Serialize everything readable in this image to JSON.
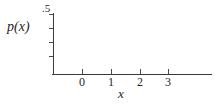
{
  "chart_data": {
    "type": "line",
    "title": "",
    "xlabel": "x",
    "ylabel": "p(x)",
    "xlim": [
      -1,
      4.55
    ],
    "ylim": [
      0,
      0.5
    ],
    "grid": false,
    "legend": null,
    "series": [],
    "x": [],
    "values": [],
    "note": "Empty axes: no data plotted inside the frame.",
    "x_tick_labels": [
      "0",
      "1",
      "2",
      "3"
    ],
    "x_tick_values": [
      0,
      1,
      2,
      3
    ],
    "y_tick_labels": [
      ".5"
    ],
    "y_tick_values": [
      0.5
    ],
    "y_minor_tick_count": 4,
    "colors": {
      "axis": "#3a3a3a",
      "tick": "#4a4a4a",
      "text": "#262626",
      "background": "#ffffff"
    }
  },
  "axes": {
    "y_top_label": ".5",
    "y_title": "p(x)",
    "x_title": "x",
    "x_ticks": [
      {
        "label": "0",
        "left_px": 82
      },
      {
        "label": "1",
        "left_px": 111
      },
      {
        "label": "2",
        "left_px": 140
      },
      {
        "label": "3",
        "left_px": 168
      }
    ],
    "y_ticks": [
      {
        "top_px": 14
      },
      {
        "top_px": 28
      },
      {
        "top_px": 42
      },
      {
        "top_px": 56
      }
    ]
  }
}
